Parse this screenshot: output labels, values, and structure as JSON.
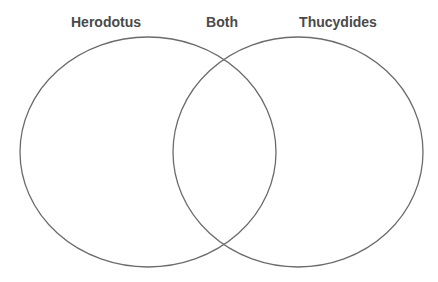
{
  "diagram": {
    "type": "venn",
    "labels": {
      "left": "Herodotus",
      "center": "Both",
      "right": "Thucydides"
    },
    "sets": [
      {
        "name": "Herodotus",
        "cx": 148,
        "cy": 152,
        "rx": 128,
        "ry": 115
      },
      {
        "name": "Thucydides",
        "cx": 298,
        "cy": 152,
        "rx": 125,
        "ry": 115
      }
    ],
    "intersection_label": "Both",
    "colors": {
      "stroke": "#6b6b6b",
      "label": "#4a4a4a",
      "background": "#ffffff"
    }
  }
}
